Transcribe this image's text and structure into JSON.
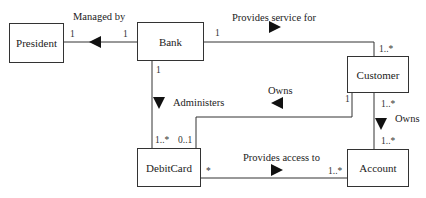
{
  "classes": {
    "president": "President",
    "bank": "Bank",
    "customer": "Customer",
    "debitcard": "DebitCard",
    "account": "Account"
  },
  "associations": {
    "managed_by": {
      "label": "Managed by",
      "direction": "left",
      "mult_president": "1",
      "mult_bank": "1"
    },
    "provides_service_for": {
      "label": "Provides service for",
      "direction": "right",
      "mult_bank": "1",
      "mult_customer": "1..*"
    },
    "administers": {
      "label": "Administers",
      "direction": "down",
      "mult_bank": "1",
      "mult_debitcard": "1..*"
    },
    "owns_card": {
      "label": "Owns",
      "direction": "left",
      "mult_customer": "1",
      "mult_debitcard": "0..1"
    },
    "owns_account": {
      "label": "Owns",
      "direction": "down",
      "mult_customer": "1..*",
      "mult_account": "1..*"
    },
    "provides_access_to": {
      "label": "Provides access to",
      "direction": "right",
      "mult_debitcard": "*",
      "mult_account": "1..*"
    }
  }
}
